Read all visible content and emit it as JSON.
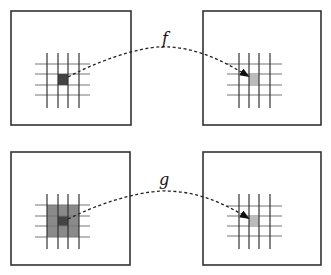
{
  "diagram": {
    "rows": [
      {
        "name": "f",
        "label": "f",
        "source_panel": {
          "box": [
            11,
            11,
            120,
            114
          ],
          "grid_x": [
            47,
            58,
            68,
            79
          ],
          "grid_y": [
            64,
            74,
            85,
            95
          ],
          "highlight": "single-dark-cell"
        },
        "target_panel": {
          "box": [
            203,
            11,
            118,
            114
          ],
          "grid_x": [
            239,
            249,
            259,
            270
          ],
          "grid_y": [
            64,
            74,
            85,
            95
          ],
          "highlight": "single-light-cell"
        }
      },
      {
        "name": "g",
        "label": "g",
        "source_panel": {
          "box": [
            11,
            152,
            119,
            113
          ],
          "grid_x": [
            47,
            58,
            68,
            79
          ],
          "grid_y": [
            205,
            216,
            226,
            237
          ],
          "highlight": "3x3-neighborhood-with-dark-center"
        },
        "target_panel": {
          "box": [
            203,
            152,
            118,
            113
          ],
          "grid_x": [
            239,
            249,
            259,
            270
          ],
          "grid_y": [
            206,
            216,
            226,
            236
          ],
          "highlight": "single-light-cell"
        }
      }
    ],
    "colors": {
      "box_border": "#333333",
      "grid_line_vertical": "#333333",
      "grid_line_horizontal": "#777777",
      "dark_cell": "#444444",
      "neighborhood_fill": "#8a8a8a",
      "light_cell": "#bbbbbb",
      "arrow": "#222222"
    }
  }
}
